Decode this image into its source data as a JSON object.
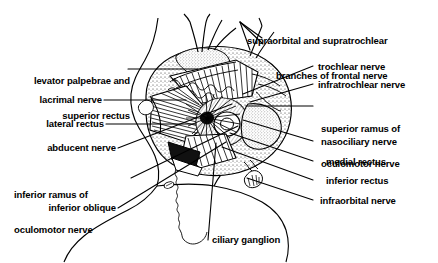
{
  "figure": {
    "type": "anatomical-illustration",
    "background_color": "#ffffff",
    "ink_color": "#000000",
    "width": 438,
    "height": 263
  },
  "labels": {
    "supraorbital_supratrochlear": {
      "line1": "supraorbital and supratrochlear",
      "line2": "branches of frontal nerve"
    },
    "trochlear_nerve": "trochlear nerve",
    "infratrochlear_nerve": "infratrochlear nerve",
    "superior_ramus_oculomotor": {
      "line1": "superior ramus of",
      "line2": "oculomotor nerve"
    },
    "nasociliary_nerve": "nasociliary nerve",
    "medial_rectus": "medial rectus",
    "inferior_rectus": "inferior rectus",
    "infraorbital_nerve": "infraorbital nerve",
    "levator_superior_rectus": {
      "line1": "levator palpebrae and",
      "line2": "superior rectus"
    },
    "lacrimal_nerve": "lacrimal nerve",
    "lateral_rectus": "lateral rectus",
    "abducent_nerve": "abducent nerve",
    "inferior_ramus_oculomotor": {
      "line1": "inferior ramus of",
      "line2": "oculomotor nerve"
    },
    "inferior_oblique": "inferior oblique",
    "ciliary_ganglion": "ciliary ganglion"
  }
}
